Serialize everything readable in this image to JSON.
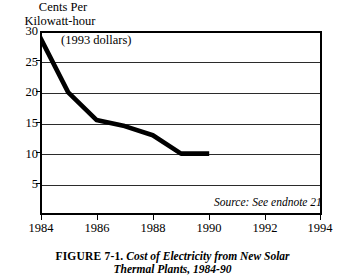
{
  "figure": {
    "caption_number": "FIGURE 7-1.",
    "caption_title": "Cost of Electricity from New Solar",
    "caption_title_line2": "Thermal Plants, 1984-90"
  },
  "chart": {
    "y_axis_title_line1": "Cents Per",
    "y_axis_title_line2": "Kilowatt-hour",
    "annotation": "(1993 dollars)",
    "source_note": "Source: See endnote 21"
  },
  "chart_data": {
    "type": "line",
    "title": "Cost of Electricity from New Solar Thermal Plants, 1984-90",
    "subtitle": "(1993 dollars)",
    "xlabel": "",
    "ylabel": "Cents Per Kilowatt-hour",
    "xlim": [
      1984,
      1994
    ],
    "ylim": [
      0,
      30
    ],
    "xticks": [
      1984,
      1986,
      1988,
      1990,
      1992,
      1994
    ],
    "xticklabels": [
      "1984",
      "1986",
      "1988",
      "1990",
      "1992",
      "1994"
    ],
    "yticks": [
      5,
      10,
      15,
      20,
      25,
      30
    ],
    "yticklabels": [
      "5",
      "10",
      "15",
      "20",
      "25",
      "30"
    ],
    "grid": "horizontal",
    "legend": "none",
    "annotations": [
      "(1993 dollars)",
      "Source: See endnote 21"
    ],
    "series": [
      {
        "name": "Cost of electricity from new solar thermal plants",
        "color": "#000000",
        "linewidth": 4,
        "x": [
          1984,
          1985,
          1986,
          1987,
          1988,
          1989,
          1990
        ],
        "values": [
          29,
          20,
          15.5,
          14.5,
          13,
          10,
          10
        ]
      }
    ]
  }
}
